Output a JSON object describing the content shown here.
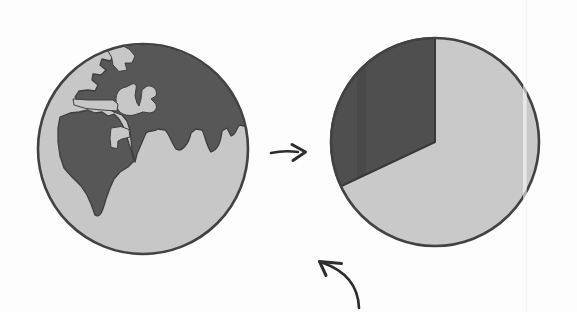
{
  "globe": {
    "label": "Earth globe showing Africa, Europe and Asia",
    "landmasses": [
      "Africa",
      "Eurasia"
    ],
    "seas": [
      "Mediterranean Sea",
      "Red Sea",
      "Arctic inlet",
      "Atlantic strait"
    ]
  },
  "arrows": {
    "transform_arrow": "right arrow from globe to pie chart",
    "annotation_arrow": "curved arrow pointing up-left at the pie chart"
  },
  "chart_data": {
    "type": "pie",
    "title": "",
    "labels_shown": false,
    "series": [
      {
        "name": "dark slice",
        "value": 32
      },
      {
        "name": "light slice",
        "value": 68
      }
    ],
    "start_angle_deg": 90,
    "direction": "counterclockwise",
    "note": "values estimated from drawing; no numeric labels rendered"
  },
  "artifacts": {
    "page_crease": "faint vertical scan crease near right side",
    "wedge_band": "slightly darker vertical print band inside the dark slice"
  },
  "colors": {
    "bg": "#fdfdfd",
    "ocean": "#c7c7c7",
    "land": "#575757",
    "land_edge": "#3e3e3e",
    "outline": "#424242",
    "pie_light": "#c9c9c9",
    "pie_dark": "#4f4f4f",
    "wedge_edge": "#383838",
    "ink": "#2d2d2d"
  }
}
